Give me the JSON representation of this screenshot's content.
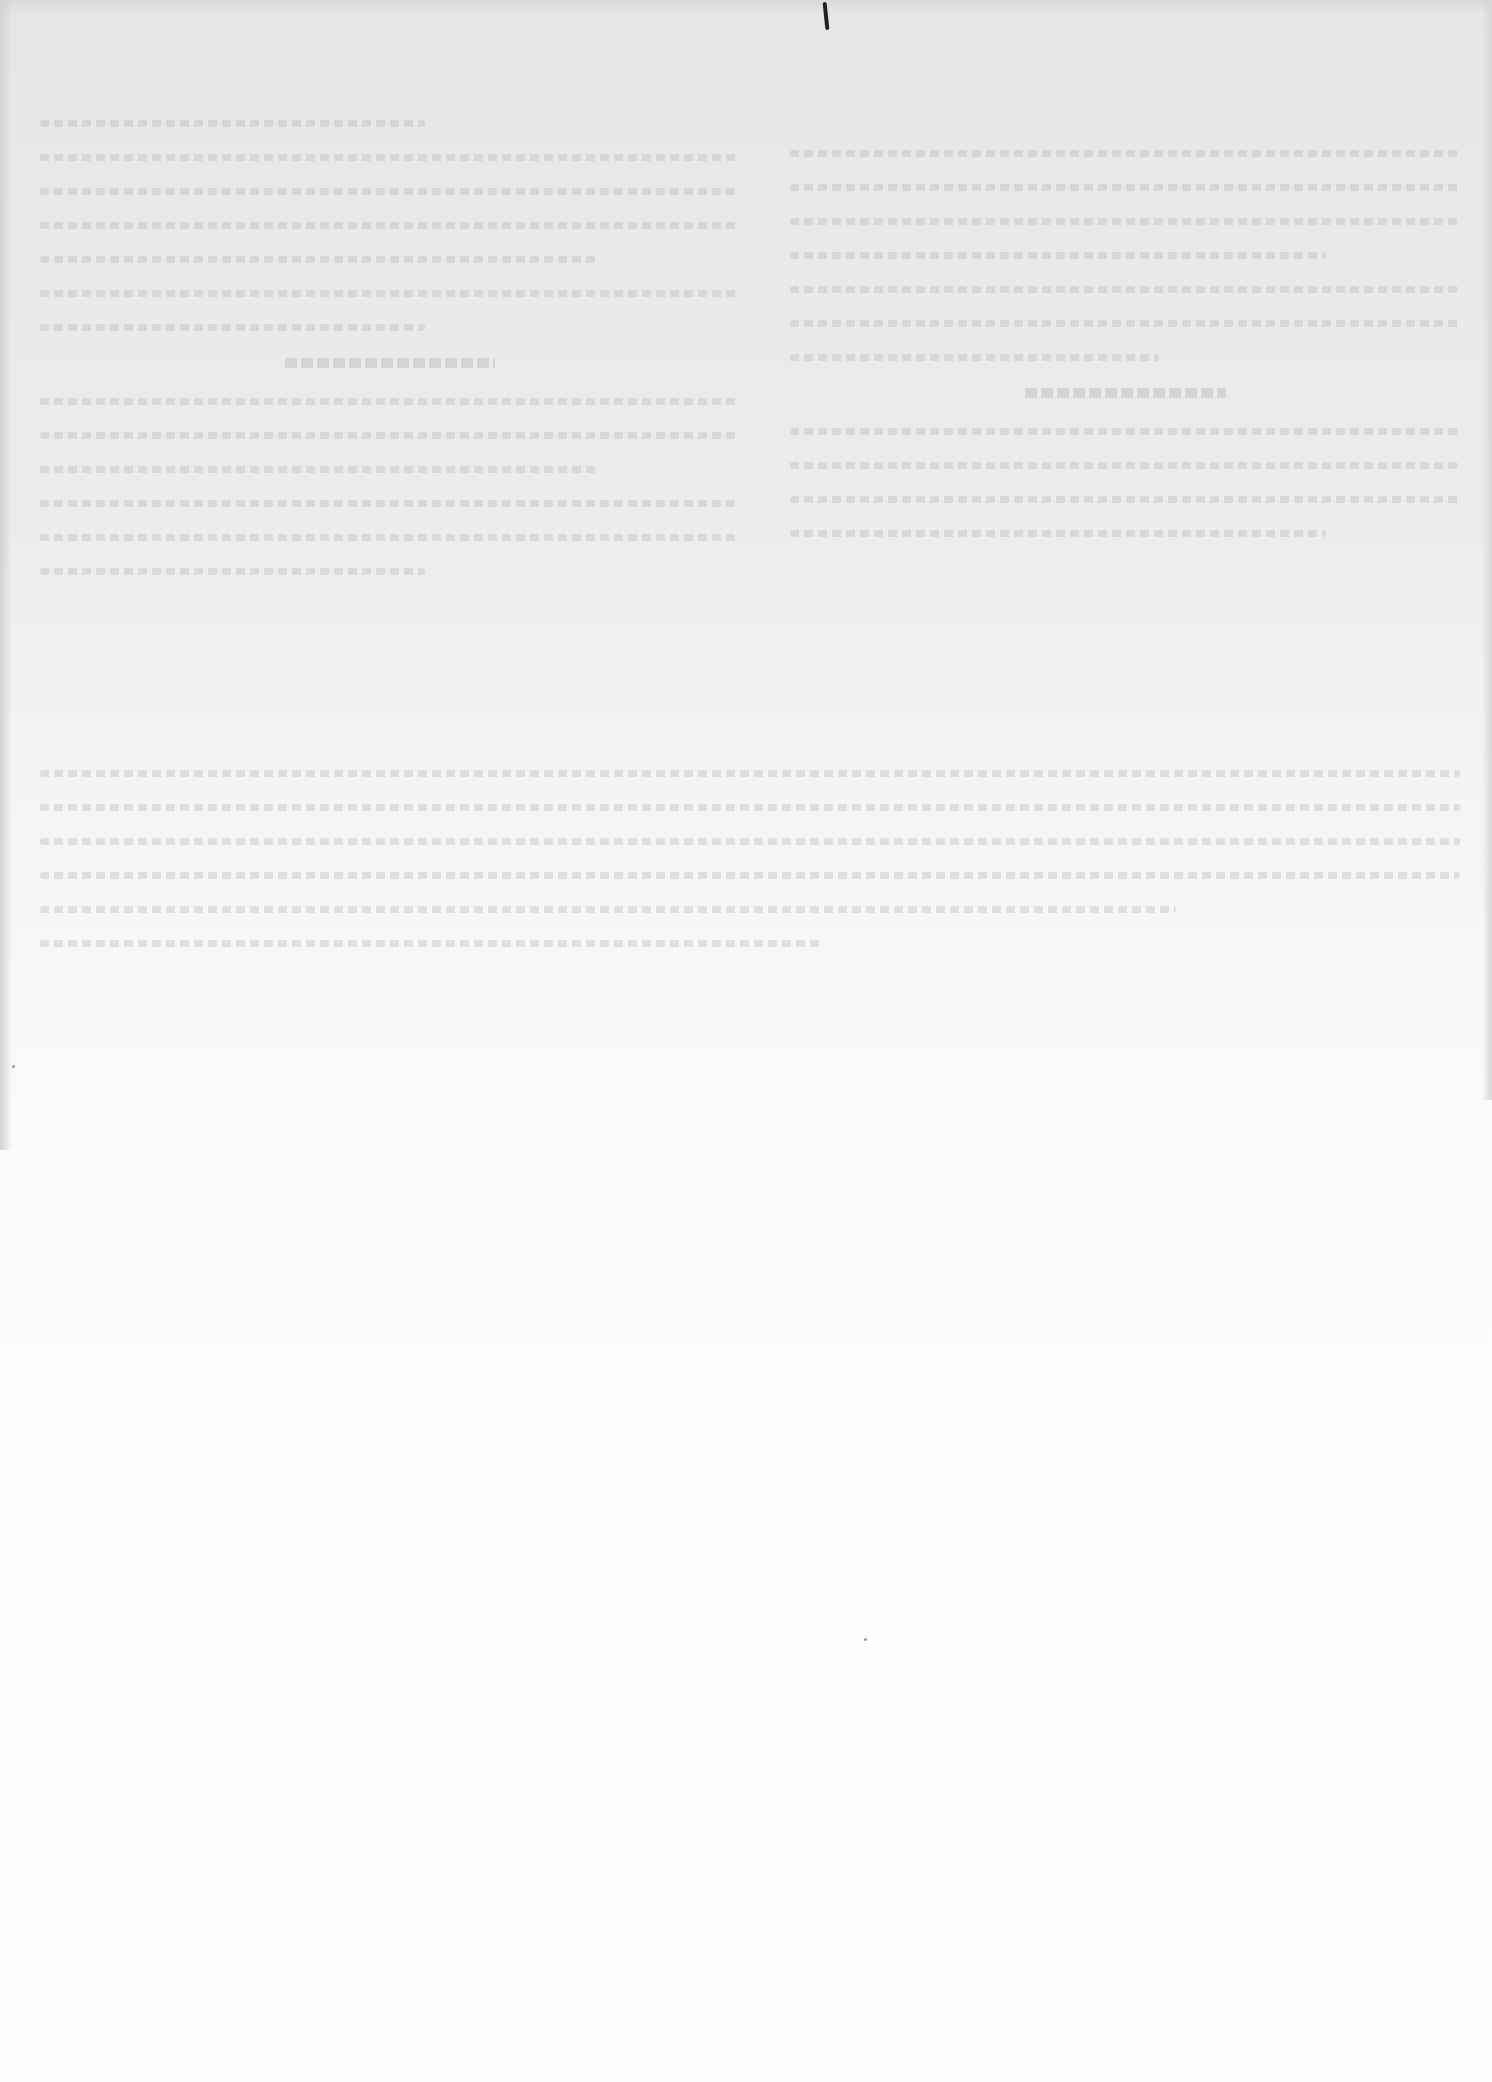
{
  "page": {
    "type": "scanned-page-verso",
    "background": "#f4f4f4",
    "legible_text": []
  }
}
